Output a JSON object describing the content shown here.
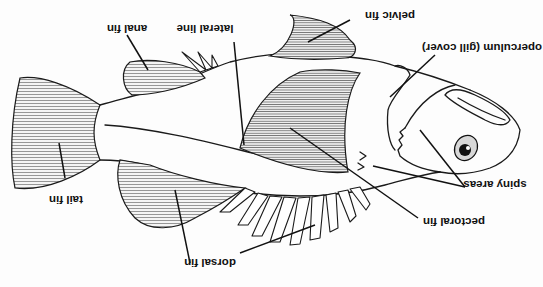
{
  "diagram": {
    "title": "",
    "orientation": "rotated-180",
    "labels": [
      {
        "id": "anal-fin",
        "text": "anal fin"
      },
      {
        "id": "lateral-line",
        "text": "lateral line"
      },
      {
        "id": "pelvic-fin",
        "text": "pelvic fin"
      },
      {
        "id": "operculum",
        "text": "operculum (gill cover)"
      },
      {
        "id": "tail-fin",
        "text": "tail fin"
      },
      {
        "id": "spiny-areas",
        "text": "spiny areas"
      },
      {
        "id": "pectoral-fin",
        "text": "pectoral fin"
      },
      {
        "id": "dorsal-fin",
        "text": "dorsal fin"
      }
    ]
  }
}
